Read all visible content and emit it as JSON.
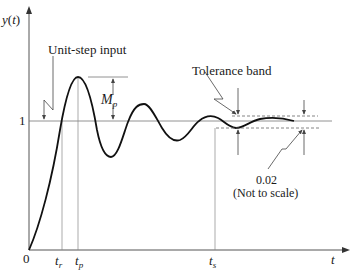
{
  "diagram": {
    "type": "step-response",
    "axes": {
      "y_label": "y(t)",
      "x_label": "t",
      "origin_label": "0",
      "level_one_label": "1"
    },
    "time_markers": {
      "rise_time": {
        "base": "t",
        "sub": "r"
      },
      "peak_time": {
        "base": "t",
        "sub": "p"
      },
      "settling_time": {
        "base": "t",
        "sub": "s"
      }
    },
    "annotations": {
      "unit_step_input": "Unit-step input",
      "overshoot": {
        "base": "M",
        "sub": "p"
      },
      "tolerance_band": "Tolerance band",
      "tolerance_value": "0.02",
      "tolerance_note": "(Not to scale)"
    },
    "colors": {
      "curve": "#111111",
      "axes": "#555555",
      "guides": "#888888",
      "text": "#1a1a1a"
    }
  }
}
